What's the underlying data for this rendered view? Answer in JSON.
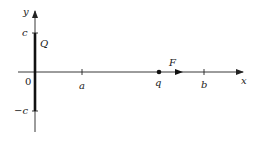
{
  "diagram": {
    "type": "physics-charged-rod-on-y-axis",
    "axes": {
      "x_label": "x",
      "y_label": "y",
      "origin_label": "0"
    },
    "rod": {
      "label": "Q",
      "top_label": "c",
      "bottom_label": "−c"
    },
    "x_ticks": [
      {
        "label": "a"
      },
      {
        "label": "b"
      }
    ],
    "point_charge": {
      "label": "q"
    },
    "force": {
      "label": "F"
    },
    "colors": {
      "line": "#222222",
      "background": "#ffffff"
    }
  }
}
